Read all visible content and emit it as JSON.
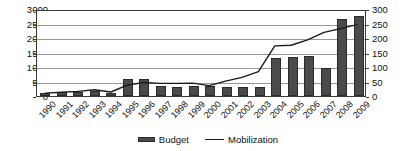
{
  "chart_data": {
    "type": "bar",
    "title": "",
    "xlabel": "",
    "ylabel": "",
    "grid": true,
    "legend_position": "bottom",
    "categories": [
      "1990",
      "1991",
      "1992",
      "1993",
      "1994",
      "1995",
      "1996",
      "1997",
      "1998",
      "1999",
      "2000",
      "2001",
      "2002",
      "2003",
      "2004",
      "2005",
      "2006",
      "2007",
      "2008",
      "2009"
    ],
    "axes": {
      "left": {
        "label": "",
        "ylim": [
          0,
          3000
        ],
        "ticks": [
          0,
          500,
          1000,
          1500,
          2000,
          2500,
          3000
        ],
        "tick_labels": [
          "0",
          "500",
          "1000",
          "1500",
          "2000",
          "2500",
          "3000"
        ]
      },
      "right": {
        "label": "",
        "ylim": [
          0,
          300
        ],
        "ticks": [
          0,
          50,
          100,
          150,
          200,
          250,
          300
        ],
        "tick_labels": [
          "0",
          "50",
          "100",
          "150",
          "200",
          "250",
          "300"
        ]
      }
    },
    "series": [
      {
        "name": "Budget",
        "type": "bar",
        "axis": "left",
        "color": "#4a4a4a",
        "values": [
          100,
          140,
          150,
          190,
          120,
          600,
          585,
          355,
          300,
          360,
          340,
          300,
          305,
          305,
          1300,
          1340,
          1375,
          950,
          2670,
          2770
        ]
      },
      {
        "name": "Mobilization",
        "type": "line",
        "axis": "right",
        "color": "#1a1a1a",
        "values": [
          10,
          13,
          16,
          22,
          14,
          38,
          47,
          44,
          44,
          45,
          36,
          52,
          65,
          85,
          175,
          177,
          196,
          222,
          235,
          249
        ]
      }
    ],
    "legend": [
      {
        "label": "Budget",
        "marker": "bar-swatch"
      },
      {
        "label": "Mobilization",
        "marker": "line-swatch"
      }
    ]
  }
}
